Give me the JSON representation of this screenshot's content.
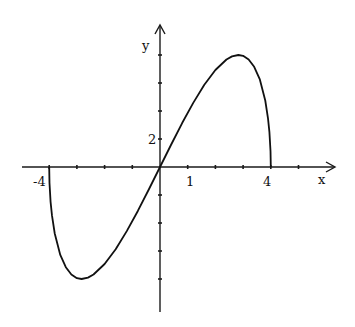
{
  "chart_data": {
    "type": "line",
    "title": "",
    "function": "y = x*sqrt(16 - x^2)",
    "xlabel": "x",
    "ylabel": "y",
    "xlim": [
      -5.4,
      6.2
    ],
    "ylim": [
      -10.3,
      10
    ],
    "x_ticks_step": 1,
    "y_ticks_step": 2,
    "x_tick_labels": [
      {
        "value": -4,
        "text": "-4"
      },
      {
        "value": 1,
        "text": "1"
      },
      {
        "value": 4,
        "text": "4"
      }
    ],
    "y_tick_labels": [
      {
        "value": 2,
        "text": "2"
      }
    ],
    "grid": false,
    "series": [
      {
        "name": "f(x)",
        "x": [
          -4,
          -3.99,
          -3.95,
          -3.9,
          -3.8,
          -3.6,
          -3.4,
          -3.2,
          -3.0,
          -2.83,
          -2.6,
          -2.4,
          -2.0,
          -1.6,
          -1.2,
          -0.8,
          -0.4,
          0,
          0.4,
          0.8,
          1.2,
          1.6,
          2.0,
          2.4,
          2.6,
          2.83,
          3.0,
          3.2,
          3.4,
          3.6,
          3.8,
          3.9,
          3.95,
          3.99,
          4
        ],
        "values": [
          0,
          -1.13,
          -2.49,
          -3.46,
          -4.75,
          -6.28,
          -7.16,
          -7.68,
          -7.94,
          -8.0,
          -7.9,
          -7.68,
          -6.93,
          -5.87,
          -4.58,
          -3.14,
          -1.59,
          0,
          1.59,
          3.14,
          4.58,
          5.87,
          6.93,
          7.68,
          7.9,
          8.0,
          7.94,
          7.68,
          7.16,
          6.28,
          4.75,
          3.46,
          2.49,
          1.13,
          0
        ]
      }
    ],
    "extrema": {
      "max": {
        "x": 2.83,
        "y": 8
      },
      "min": {
        "x": -2.83,
        "y": -8
      }
    },
    "x_intercepts": [
      -4,
      0,
      4
    ],
    "legend": null
  },
  "labels": {
    "x_axis": "x",
    "y_axis": "y",
    "tick_neg4": "-4",
    "tick_1": "1",
    "tick_4": "4",
    "tick_y2": "2"
  }
}
